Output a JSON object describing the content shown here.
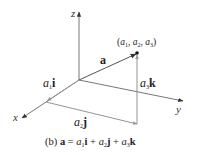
{
  "diagram": {
    "type": "3d-vector-components",
    "axes": {
      "x": {
        "label": "x"
      },
      "y": {
        "label": "y"
      },
      "z": {
        "label": "z"
      }
    },
    "vector": {
      "label": "a"
    },
    "point": {
      "open": "(",
      "a1": "a",
      "s1": "1",
      "c1": ", ",
      "a2": "a",
      "s2": "2",
      "c2": ", ",
      "a3": "a",
      "s3": "3",
      "close": ")"
    },
    "components": {
      "i": {
        "coef": "a",
        "sub": "1",
        "unit": "i"
      },
      "j": {
        "coef": "a",
        "sub": "2",
        "unit": "j"
      },
      "k": {
        "coef": "a",
        "sub": "3",
        "unit": "k"
      }
    },
    "caption": {
      "prefix": "(b) ",
      "lhs": "a",
      "eq": " = ",
      "t1c": "a",
      "t1s": "1",
      "t1u": "i",
      "plus1": " + ",
      "t2c": "a",
      "t2s": "2",
      "t2u": "j",
      "plus2": " + ",
      "t3c": "a",
      "t3s": "3",
      "t3u": "k"
    },
    "colors": {
      "axis": "#555555",
      "vector": "#555555",
      "component": "#888888",
      "text": "#222222"
    }
  }
}
